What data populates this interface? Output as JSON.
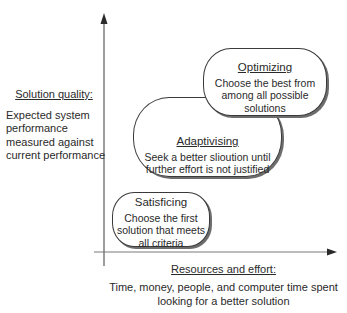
{
  "diagram": {
    "y_axis": {
      "title": "Solution quality:",
      "description": "Expected system performance measured against current performance"
    },
    "x_axis": {
      "title": "Resources and effort:",
      "description": "Time, money, people, and computer time spent looking for a better solution"
    },
    "boxes": [
      {
        "id": "satisficing",
        "title": "Satisficing",
        "text": "Choose the first solution that meets all criteria"
      },
      {
        "id": "adaptivising",
        "title": "Adaptivising",
        "text": "Seek a better slioution until further effort is not justified"
      },
      {
        "id": "optimizing",
        "title": "Optimizing",
        "text": "Choose the best from among all possible solutions"
      }
    ],
    "colors": {
      "line": "#3a3a3a",
      "shadow": "#6d6d6d",
      "text": "#2a2a2a",
      "background": "#ffffff"
    }
  }
}
